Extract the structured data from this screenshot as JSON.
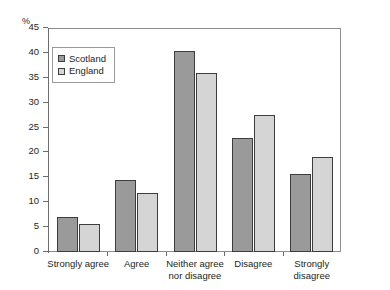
{
  "chart_data": {
    "type": "bar",
    "title": "",
    "xlabel": "",
    "ylabel": "%",
    "ylim": [
      0,
      45
    ],
    "yticks": [
      0,
      5,
      10,
      15,
      20,
      25,
      30,
      35,
      40,
      45
    ],
    "grid": false,
    "legend_position": "top-left",
    "categories": [
      "Strongly agree",
      "Agree",
      "Neither agree nor disagree",
      "Disagree",
      "Strongly disagree"
    ],
    "category_lines": [
      [
        "Strongly agree"
      ],
      [
        "Agree"
      ],
      [
        "Neither agree",
        "nor disagree"
      ],
      [
        "Disagree"
      ],
      [
        "Strongly",
        "disagree"
      ]
    ],
    "series": [
      {
        "name": "Scotland",
        "color": "#9a9a9a",
        "values": [
          7.0,
          14.5,
          40.3,
          23.0,
          15.6
        ]
      },
      {
        "name": "England",
        "color": "#d5d5d5",
        "values": [
          5.6,
          11.8,
          36.0,
          27.5,
          19.1
        ]
      }
    ]
  },
  "axis": {
    "unit_label": "%"
  },
  "legend": {
    "items": [
      {
        "label": "Scotland",
        "color": "#9a9a9a"
      },
      {
        "label": "England",
        "color": "#d5d5d5"
      }
    ]
  }
}
